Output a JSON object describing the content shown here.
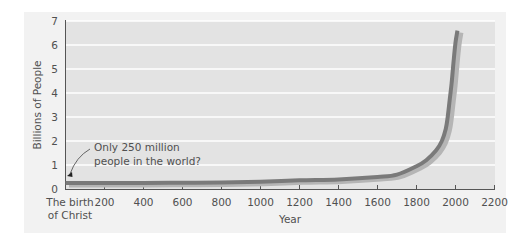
{
  "chart_data": {
    "type": "line",
    "title": "",
    "xlabel": "Year",
    "ylabel": "Billions of People",
    "xlim": [
      0,
      2200
    ],
    "ylim": [
      0,
      7
    ],
    "grid": true,
    "x_ticks": [
      {
        "value": 0,
        "label_line1": "The birth",
        "label_line2": "of Christ"
      },
      {
        "value": 200,
        "label": "200"
      },
      {
        "value": 400,
        "label": "400"
      },
      {
        "value": 600,
        "label": "600"
      },
      {
        "value": 800,
        "label": "800"
      },
      {
        "value": 1000,
        "label": "1000"
      },
      {
        "value": 1200,
        "label": "1200"
      },
      {
        "value": 1400,
        "label": "1400"
      },
      {
        "value": 1600,
        "label": "1600"
      },
      {
        "value": 1800,
        "label": "1800"
      },
      {
        "value": 2000,
        "label": "2000"
      },
      {
        "value": 2200,
        "label": "2200"
      }
    ],
    "y_ticks": [
      "0",
      "1",
      "2",
      "3",
      "4",
      "5",
      "6",
      "7"
    ],
    "series": [
      {
        "name": "World population",
        "color": "#7a7a7a",
        "shadow_color": "#b5b5b5",
        "x": [
          0,
          200,
          400,
          600,
          800,
          1000,
          1200,
          1400,
          1600,
          1700,
          1800,
          1850,
          1900,
          1930,
          1950,
          1960,
          1970,
          1980,
          1990,
          2000,
          2010
        ],
        "y": [
          0.25,
          0.25,
          0.25,
          0.26,
          0.27,
          0.3,
          0.36,
          0.4,
          0.5,
          0.6,
          0.95,
          1.2,
          1.6,
          2.0,
          2.5,
          3.0,
          3.7,
          4.4,
          5.3,
          6.1,
          6.6
        ]
      }
    ],
    "annotations": [
      {
        "text_line1": "Only 250 million",
        "text_line2": "people in the world?",
        "points_to": {
          "x": 0,
          "y": 0.25
        }
      }
    ]
  },
  "colors": {
    "panel_bg": "#f2f2f2",
    "plot_bg": "#e3e3e3",
    "gridline": "#ffffff",
    "axis": "#555555"
  }
}
